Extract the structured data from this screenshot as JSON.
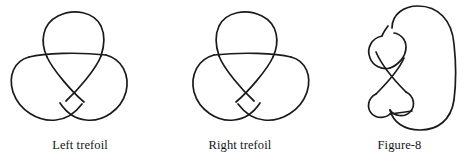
{
  "page": {
    "background_color": "#ffffff",
    "ink_color": "#1a1a1a",
    "width": 469,
    "height": 165
  },
  "figures": [
    {
      "id": "left-trefoil",
      "caption": "Left trefoil",
      "knot_type": "trefoil",
      "chirality": "left",
      "crossing_number": 3
    },
    {
      "id": "right-trefoil",
      "caption": "Right trefoil",
      "knot_type": "trefoil",
      "chirality": "right",
      "crossing_number": 3
    },
    {
      "id": "figure-eight",
      "caption": "Figure-8",
      "knot_type": "figure-eight",
      "chirality": "amphichiral",
      "crossing_number": 4
    }
  ]
}
